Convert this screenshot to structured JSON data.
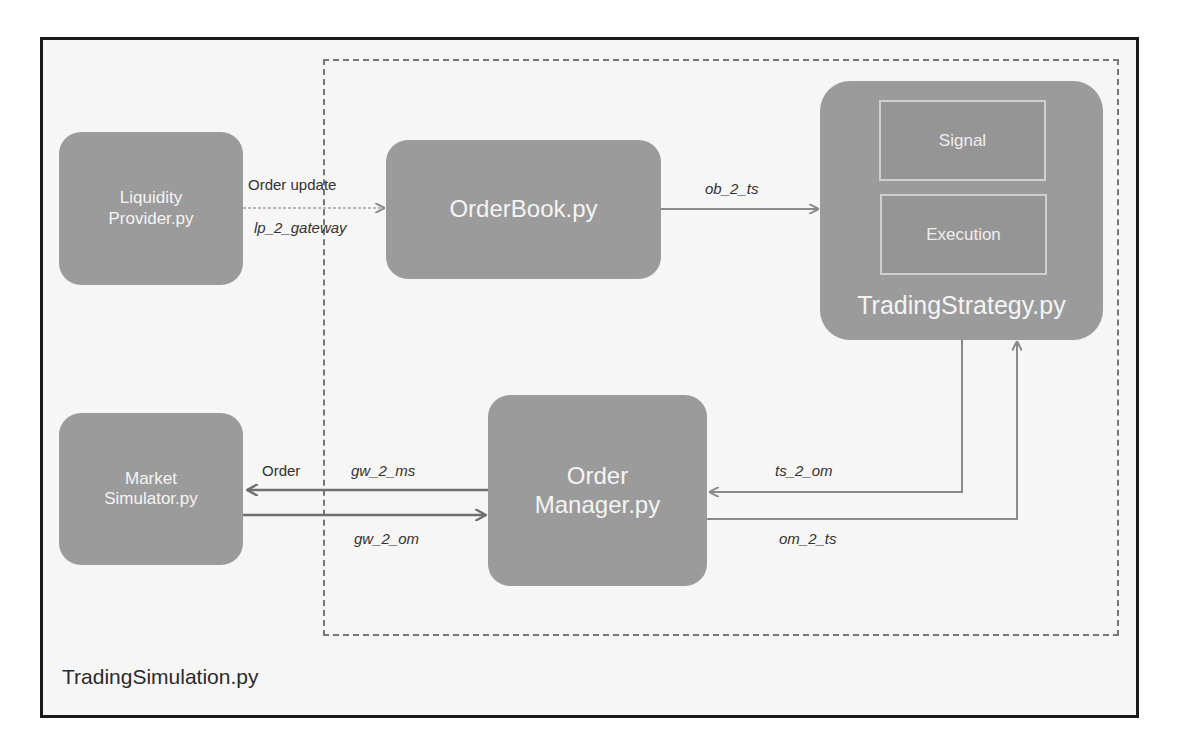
{
  "diagram": {
    "outer_container": {
      "label": "TradingSimulation.py"
    },
    "nodes": {
      "liquidity_provider": {
        "label": "Liquidity\nProvider.py"
      },
      "order_book": {
        "label": "OrderBook.py"
      },
      "trading_strategy": {
        "label": "TradingStrategy.py",
        "components": [
          {
            "label": "Signal"
          },
          {
            "label": "Execution"
          }
        ]
      },
      "market_simulator": {
        "label": "Market\nSimulator.py"
      },
      "order_manager": {
        "label": "Order\nManager.py"
      }
    },
    "edges": [
      {
        "from": "liquidity_provider",
        "to": "order_book",
        "label_top": "Order update",
        "label_bottom": "lp_2_gateway"
      },
      {
        "from": "order_book",
        "to": "trading_strategy",
        "label": "ob_2_ts"
      },
      {
        "from": "order_manager",
        "to": "market_simulator",
        "label_left": "Order",
        "label": "gw_2_ms"
      },
      {
        "from": "market_simulator",
        "to": "order_manager",
        "label": "gw_2_om"
      },
      {
        "from": "trading_strategy",
        "to": "order_manager",
        "label": "ts_2_om"
      },
      {
        "from": "order_manager",
        "to": "trading_strategy",
        "label": "om_2_ts"
      }
    ],
    "colors": {
      "node_fill": "#9b9b9b",
      "node_text": "#f4f4f4",
      "arrow": "#8a8a8a",
      "dashed_border": "#777777",
      "frame_border": "#1a1a1a"
    }
  }
}
